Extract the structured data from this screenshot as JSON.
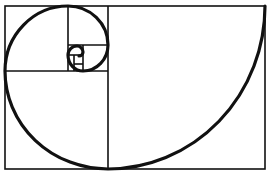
{
  "diagram": {
    "type": "golden-spiral",
    "colors": {
      "stroke": "#111111",
      "background": "#ffffff"
    },
    "outer_rect": {
      "x": 5,
      "y": 6,
      "w": 260,
      "h": 163
    },
    "caption": ""
  }
}
